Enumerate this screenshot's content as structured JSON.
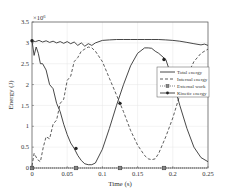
{
  "chart_data": {
    "type": "line",
    "title": "",
    "xlabel": "Time (s)",
    "ylabel": "Energy (J)",
    "y_multiplier": "×10^6",
    "xlim": [
      0,
      0.25
    ],
    "ylim": [
      0,
      3.5
    ],
    "grid": true,
    "legend_position": "right-center",
    "xticks": [
      "0",
      "0.05",
      "0.1",
      "0.15",
      "0.2",
      "0.25"
    ],
    "yticks": [
      "0",
      "0.5",
      "1",
      "1.5",
      "2",
      "2.5",
      "3",
      "3.5"
    ],
    "series": [
      {
        "name": "Total energy",
        "style": "solid",
        "marker": "none",
        "x": [
          0,
          0.005,
          0.01,
          0.015,
          0.02,
          0.025,
          0.03,
          0.035,
          0.04,
          0.045,
          0.05,
          0.055,
          0.06,
          0.065,
          0.07,
          0.075,
          0.08,
          0.085,
          0.09,
          0.1,
          0.11,
          0.12,
          0.13,
          0.14,
          0.15,
          0.16,
          0.17,
          0.18,
          0.19,
          0.2,
          0.21,
          0.22,
          0.23,
          0.24,
          0.245,
          0.25
        ],
        "values": [
          3.05,
          3.03,
          3.06,
          3.02,
          3.05,
          3.01,
          3.04,
          3.0,
          3.03,
          2.99,
          3.03,
          2.98,
          3.02,
          2.94,
          3.0,
          2.92,
          2.98,
          2.94,
          3.0,
          3.06,
          3.07,
          3.08,
          3.08,
          3.08,
          3.08,
          3.08,
          3.08,
          3.08,
          3.07,
          3.06,
          3.04,
          3.01,
          2.98,
          2.95,
          2.97,
          2.94
        ]
      },
      {
        "name": "Internal energy",
        "style": "dashed",
        "marker": "none",
        "x": [
          0,
          0.003,
          0.008,
          0.012,
          0.016,
          0.02,
          0.025,
          0.03,
          0.035,
          0.04,
          0.045,
          0.05,
          0.055,
          0.06,
          0.065,
          0.07,
          0.075,
          0.08,
          0.085,
          0.09,
          0.1,
          0.11,
          0.12,
          0.13,
          0.14,
          0.15,
          0.16,
          0.165,
          0.17,
          0.175,
          0.18,
          0.19,
          0.2,
          0.21,
          0.22,
          0.23,
          0.24,
          0.25
        ],
        "values": [
          0.05,
          0.35,
          0.2,
          0.15,
          0.5,
          0.75,
          0.7,
          1.05,
          1.15,
          1.55,
          1.65,
          2.1,
          2.2,
          2.55,
          2.65,
          2.8,
          2.85,
          2.9,
          2.88,
          2.8,
          2.55,
          2.15,
          1.75,
          1.35,
          0.9,
          0.55,
          0.3,
          0.22,
          0.2,
          0.22,
          0.35,
          0.75,
          1.2,
          1.75,
          2.2,
          2.55,
          2.75,
          2.85
        ]
      },
      {
        "name": "External work",
        "style": "dotted",
        "marker": "square",
        "x": [
          0,
          0.0625,
          0.125,
          0.1875,
          0.25
        ],
        "values": [
          0,
          0,
          0,
          0,
          0
        ],
        "marker_x": [
          0,
          0.0625,
          0.125,
          0.1875
        ]
      },
      {
        "name": "Kinetic energy",
        "style": "solid",
        "marker": "circle",
        "x": [
          0,
          0.003,
          0.006,
          0.009,
          0.012,
          0.015,
          0.02,
          0.025,
          0.03,
          0.035,
          0.04,
          0.045,
          0.05,
          0.055,
          0.06,
          0.065,
          0.07,
          0.075,
          0.08,
          0.085,
          0.09,
          0.1,
          0.11,
          0.12,
          0.13,
          0.14,
          0.15,
          0.16,
          0.165,
          0.17,
          0.175,
          0.18,
          0.19,
          0.2,
          0.21,
          0.22,
          0.23,
          0.24,
          0.25
        ],
        "values": [
          3.05,
          2.7,
          2.9,
          2.75,
          2.5,
          2.5,
          2.35,
          2.0,
          1.9,
          1.55,
          1.35,
          1.05,
          0.8,
          0.6,
          0.47,
          0.3,
          0.18,
          0.1,
          0.08,
          0.08,
          0.12,
          0.45,
          0.95,
          1.5,
          2.0,
          2.45,
          2.75,
          2.88,
          2.88,
          2.87,
          2.8,
          2.75,
          2.6,
          2.1,
          1.5,
          0.95,
          0.5,
          0.25,
          0.15
        ],
        "marker_x": [
          0,
          0.0625,
          0.125,
          0.1875
        ],
        "marker_values": [
          3.05,
          0.47,
          1.55,
          2.6
        ]
      }
    ]
  }
}
